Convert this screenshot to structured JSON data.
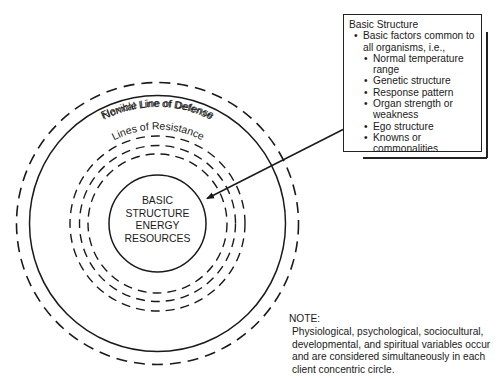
{
  "diagram": {
    "center": {
      "x": 157.5,
      "y": 223.5
    },
    "rings": [
      {
        "id": "flexible-line-of-defense",
        "label": "Flexible Line of Defense",
        "radius": 141,
        "style": "dashed"
      },
      {
        "id": "normal-line-of-defense",
        "label": "Normal Line of Defense",
        "radius": 128,
        "style": "solid"
      },
      {
        "id": "lines-of-resistance-outer",
        "label": "Lines of Resistance",
        "radius": 87.5,
        "style": "dashed"
      },
      {
        "id": "lines-of-resistance-middle",
        "label": "",
        "radius": 78,
        "style": "dashed"
      },
      {
        "id": "lines-of-resistance-inner",
        "label": "",
        "radius": 69.5,
        "style": "dashed"
      },
      {
        "id": "basic-structure-core",
        "label": "",
        "radius": 48.5,
        "style": "solid"
      }
    ],
    "core_text": [
      "BASIC",
      "STRUCTURE",
      "ENERGY",
      "RESOURCES"
    ],
    "labels": {
      "flexible": "Flexible Line of Defense",
      "normal": "Normal Line of Defense",
      "resistance": "Lines of Resistance"
    },
    "arrow": {
      "from": {
        "x": 342,
        "y": 130
      },
      "to": {
        "x": 206,
        "y": 199
      }
    }
  },
  "info_box": {
    "title": "Basic Structure",
    "level1": [
      "Basic factors common to all organisms, i.e.,"
    ],
    "items": [
      "Normal temperature range",
      "Genetic structure",
      "Response pattern",
      "Organ strength or weakness",
      "Ego structure",
      "Knowns or commonalities"
    ]
  },
  "note": {
    "label": "NOTE:",
    "text": "Physiological, psychological, sociocultural, developmental, and spiritual variables occur and are considered simultaneously in each client concentric circle."
  },
  "colors": {
    "ink": "#1a1a1a",
    "background": "#ffffff"
  }
}
